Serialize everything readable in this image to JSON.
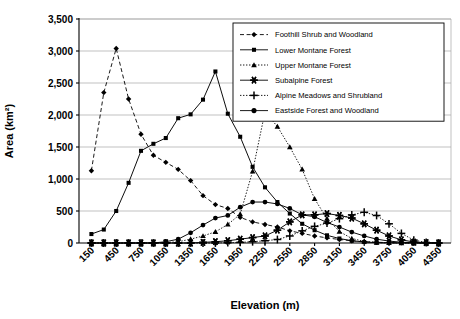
{
  "chart_data": {
    "type": "line",
    "title": "",
    "xlabel": "Elevation (m)",
    "ylabel": "Area (km²)",
    "xlim": [
      0,
      4500
    ],
    "ylim": [
      0,
      3500
    ],
    "ytick_step": 500,
    "yticks": [
      "0",
      "500",
      "1,000",
      "1,500",
      "2,000",
      "2,500",
      "3,000",
      "3,500"
    ],
    "ytick_values": [
      0,
      500,
      1000,
      1500,
      2000,
      2500,
      3000,
      3500
    ],
    "xticks": [
      "150",
      "450",
      "750",
      "1050",
      "1350",
      "1650",
      "1950",
      "2250",
      "2550",
      "2850",
      "3150",
      "3450",
      "3750",
      "4050",
      "4350"
    ],
    "xtick_values": [
      150,
      450,
      750,
      1050,
      1350,
      1650,
      1950,
      2250,
      2550,
      2850,
      3150,
      3450,
      3750,
      4050,
      4350
    ],
    "x": [
      150,
      300,
      450,
      600,
      750,
      900,
      1050,
      1200,
      1350,
      1500,
      1650,
      1800,
      1950,
      2100,
      2250,
      2400,
      2550,
      2700,
      2850,
      3000,
      3150,
      3300,
      3450,
      3600,
      3750,
      3900,
      4050,
      4200,
      4350
    ],
    "grid": true,
    "legend_position": "top-right",
    "series": [
      {
        "name": "Foothill Shrub and Woodland",
        "marker": "diamond",
        "dash": "dashed",
        "values": [
          1130,
          2350,
          3040,
          2250,
          1700,
          1370,
          1260,
          1150,
          975,
          740,
          600,
          540,
          400,
          330,
          290,
          250,
          190,
          150,
          110,
          80,
          55,
          35,
          20,
          12,
          6,
          3,
          1,
          0,
          0
        ]
      },
      {
        "name": "Lower Montane Forest",
        "marker": "square",
        "dash": "solid",
        "values": [
          140,
          210,
          500,
          940,
          1440,
          1550,
          1640,
          1950,
          2010,
          2240,
          2680,
          2020,
          1660,
          1190,
          870,
          640,
          460,
          300,
          200,
          120,
          70,
          35,
          15,
          5,
          2,
          0,
          0,
          0,
          0
        ]
      },
      {
        "name": "Upper Montane Forest",
        "marker": "triangle",
        "dash": "dotted",
        "values": [
          0,
          0,
          0,
          0,
          0,
          0,
          5,
          20,
          60,
          110,
          175,
          290,
          450,
          1120,
          2050,
          1820,
          1500,
          1150,
          690,
          380,
          180,
          70,
          25,
          8,
          2,
          0,
          0,
          0,
          0
        ]
      },
      {
        "name": "Subalpine Forest",
        "marker": "asterisk",
        "dash": "solid",
        "values": [
          0,
          0,
          0,
          0,
          0,
          0,
          0,
          0,
          0,
          10,
          20,
          35,
          60,
          85,
          110,
          200,
          330,
          440,
          440,
          460,
          430,
          390,
          300,
          200,
          110,
          50,
          15,
          5,
          0
        ]
      },
      {
        "name": "Alpine Meadows and Shrubland",
        "marker": "plus",
        "dash": "dotted",
        "values": [
          0,
          0,
          0,
          0,
          0,
          0,
          0,
          0,
          0,
          0,
          0,
          5,
          10,
          20,
          35,
          55,
          110,
          190,
          260,
          310,
          380,
          440,
          480,
          430,
          300,
          150,
          45,
          8,
          0
        ]
      },
      {
        "name": "Eastside Forest and Woodland",
        "marker": "circle",
        "dash": "solid",
        "values": [
          0,
          0,
          0,
          0,
          0,
          0,
          20,
          60,
          160,
          280,
          390,
          430,
          560,
          640,
          640,
          610,
          540,
          440,
          410,
          320,
          250,
          170,
          110,
          60,
          30,
          12,
          4,
          0,
          0
        ]
      }
    ]
  },
  "axes": {
    "ylabel": "Area (km²)",
    "xlabel": "Elevation (m)"
  }
}
